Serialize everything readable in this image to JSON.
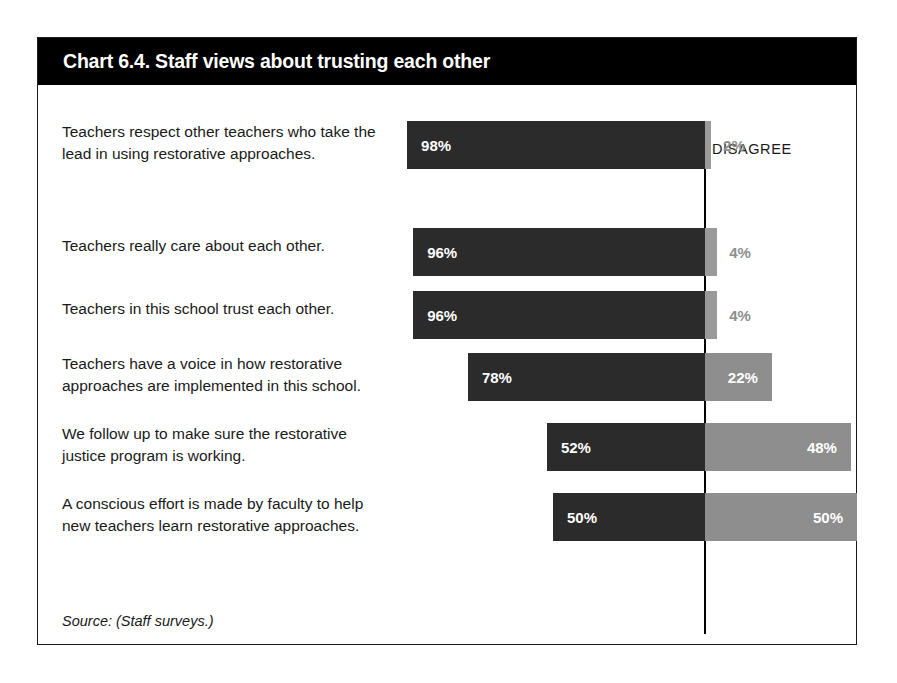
{
  "card": {
    "title": "Chart 6.4. Staff views about trusting each other",
    "source": "Source: (Staff surveys.)"
  },
  "headers": {
    "agree": "AGREE",
    "disagree": "DISAGREE"
  },
  "colors": {
    "agree_bar": "#2b2b2b",
    "disagree_bar": "#8e8e8e",
    "disagree_bar_small": "#9a9a9a",
    "title_band": "#000000",
    "border": "#1a1a1a",
    "page": "#ffffff",
    "label_text": "#1a1a1a",
    "value_text_light": "#ffffff"
  },
  "chart_data": {
    "type": "bar",
    "subtype": "diverging-stacked-bar",
    "title": "Chart 6.4. Staff views about trusting each other",
    "xlabel": "",
    "ylabel": "",
    "xlim": [
      0,
      100
    ],
    "grid": false,
    "legend_position": "top-right",
    "legend": [
      "AGREE",
      "DISAGREE"
    ],
    "units": "percent",
    "center_baseline_percent": 100,
    "categories": [
      "Teachers respect other teachers who take the lead in using restorative approaches.",
      "Teachers really care about each other.",
      "Teachers in this school trust each other.",
      "Teachers have a voice in how restorative approaches are implemented in this school.",
      "We follow up to make sure the restorative justice program is working.",
      "A conscious effort is made by faculty to help new teachers learn restorative approaches."
    ],
    "series": [
      {
        "name": "AGREE",
        "values": [
          98,
          96,
          96,
          78,
          52,
          50
        ]
      },
      {
        "name": "DISAGREE",
        "values": [
          2,
          4,
          4,
          22,
          48,
          50
        ]
      }
    ],
    "rows": [
      {
        "label": "Teachers respect other teachers who take the lead in using restorative approaches.",
        "agree": 98,
        "disagree": 2,
        "agree_label": "98%",
        "disagree_label": "2%",
        "disagree_label_inside": false
      },
      {
        "label": "Teachers really care about each other.",
        "agree": 96,
        "disagree": 4,
        "agree_label": "96%",
        "disagree_label": "4%",
        "disagree_label_inside": false
      },
      {
        "label": "Teachers in this school trust each other.",
        "agree": 96,
        "disagree": 4,
        "agree_label": "96%",
        "disagree_label": "4%",
        "disagree_label_inside": false
      },
      {
        "label": "Teachers have a voice in how restorative approaches are implemented in this school.",
        "agree": 78,
        "disagree": 22,
        "agree_label": "78%",
        "disagree_label": "22%",
        "disagree_label_inside": true
      },
      {
        "label": "We follow up to make sure the restorative justice program is working.",
        "agree": 52,
        "disagree": 48,
        "agree_label": "52%",
        "disagree_label": "48%",
        "disagree_label_inside": true
      },
      {
        "label": "A conscious effort is made by faculty to help new teachers learn restorative approaches.",
        "agree": 50,
        "disagree": 50,
        "agree_label": "50%",
        "disagree_label": "50%",
        "disagree_label_inside": true
      }
    ]
  }
}
